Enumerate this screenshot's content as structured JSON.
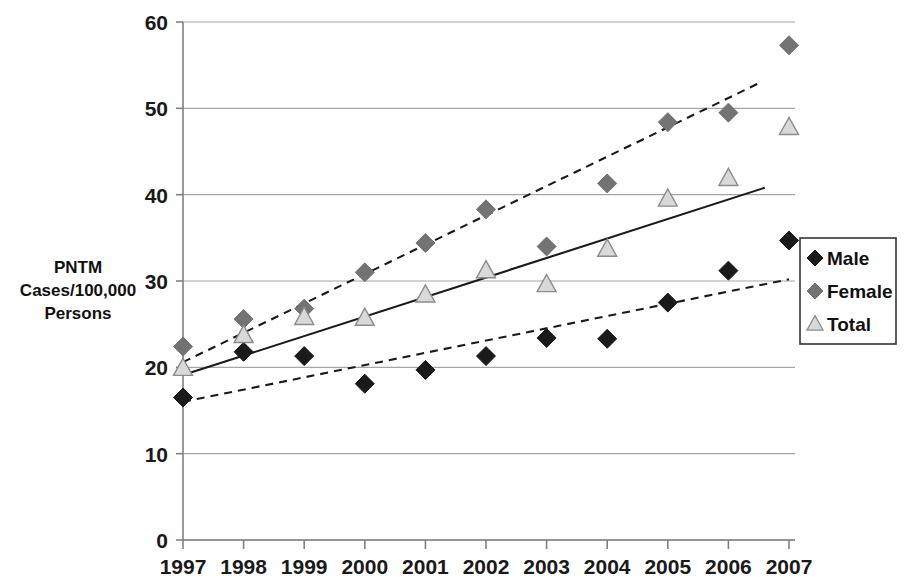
{
  "chart_data": {
    "type": "scatter",
    "title": "",
    "xlabel": "",
    "ylabel": "PNTM Cases/100,000 Persons",
    "ylabel_lines": [
      "PNTM",
      "Cases/100,000",
      "Persons"
    ],
    "x": [
      1997,
      1998,
      1999,
      2000,
      2001,
      2002,
      2003,
      2004,
      2005,
      2006,
      2007
    ],
    "categories": [
      "1997",
      "1998",
      "1999",
      "2000",
      "2001",
      "2002",
      "2003",
      "2004",
      "2005",
      "2006",
      "2007"
    ],
    "xlim": [
      1997,
      2007
    ],
    "ylim": [
      0,
      60
    ],
    "yticks": [
      0,
      10,
      20,
      30,
      40,
      50,
      60
    ],
    "ytick_labels": [
      "0",
      "10",
      "20",
      "30",
      "40",
      "50",
      "60"
    ],
    "grid": "horizontal",
    "legend_position": "right",
    "series": [
      {
        "name": "Male",
        "marker": "diamond",
        "color": "#1a1a1a",
        "values": [
          16.5,
          21.8,
          21.3,
          18.1,
          19.7,
          21.3,
          23.4,
          23.3,
          27.5,
          31.2,
          34.7
        ],
        "trendline": {
          "style": "dashed",
          "color": "#1a1a1a",
          "x_start": 1997,
          "x_end": 2007,
          "y_start": 16.0,
          "y_end": 30.2
        }
      },
      {
        "name": "Female",
        "marker": "diamond",
        "color": "#737373",
        "values": [
          22.4,
          25.6,
          26.8,
          31.0,
          34.4,
          38.3,
          34.0,
          41.3,
          48.4,
          49.5,
          57.3
        ],
        "trendline": {
          "style": "dashed",
          "color": "#1a1a1a",
          "x_start": 1997,
          "x_end": 2006.5,
          "y_start": 20.6,
          "y_end": 52.9
        }
      },
      {
        "name": "Total",
        "marker": "triangle",
        "color": "#d9d9d9",
        "values": [
          19.9,
          23.7,
          25.8,
          25.7,
          28.4,
          31.2,
          29.6,
          33.7,
          39.5,
          41.9,
          47.8
        ],
        "trendline": {
          "style": "solid",
          "color": "#1a1a1a",
          "x_start": 1997,
          "x_end": 2006.6,
          "y_start": 19.1,
          "y_end": 40.8
        }
      }
    ]
  },
  "legend": {
    "items": [
      {
        "label": "Male",
        "marker": "diamond",
        "color": "#1a1a1a"
      },
      {
        "label": "Female",
        "marker": "diamond",
        "color": "#737373"
      },
      {
        "label": "Total",
        "marker": "triangle",
        "color": "#d9d9d9"
      }
    ]
  },
  "colors": {
    "male": "#1a1a1a",
    "female": "#737373",
    "total": "#d9d9d9",
    "gridline": "#a6a6a6",
    "axis": "#808080",
    "text": "#111111",
    "background": "#ffffff"
  }
}
